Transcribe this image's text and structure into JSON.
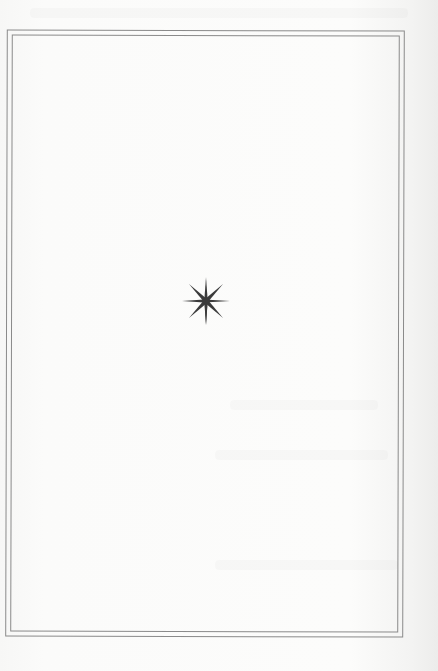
{
  "page": {
    "type": "ornamental-section-page",
    "background_color": "#fbfbfa",
    "border_color": "#8a8a8a",
    "border_style": "double-rule"
  },
  "ornament": {
    "icon": "eight-pointed-star-icon",
    "color": "#3a3a3a"
  }
}
